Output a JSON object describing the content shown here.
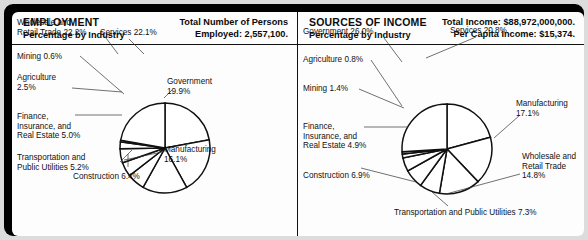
{
  "panels": [
    {
      "id": "employment",
      "title": "EMPLOYMENT",
      "subtitle": "Percentage by Industry",
      "stat_line_1": "Total Number of Persons",
      "stat_line_2": "Employed: 2,557,100.",
      "chart": {
        "type": "pie",
        "title": "EMPLOYMENT",
        "subtitle": "Percentage by Industry",
        "unit": "percent",
        "center": [
          153,
          136
        ],
        "radius": 45,
        "start_angle_deg": -90,
        "direction": "clockwise",
        "categories": [
          "Services",
          "Government",
          "Manufacturing",
          "Construction",
          "Transportation and Public Utilities",
          "Finance, Insurance, and Real Estate",
          "Agriculture",
          "Mining",
          "Wholesale and Retail Trade"
        ],
        "values": [
          22.1,
          19.9,
          16.1,
          6.4,
          5.2,
          5.0,
          2.5,
          0.6,
          22.2
        ],
        "labels": [
          {
            "text": "Services 22.1%",
            "x": 88,
            "y": 16,
            "align": "left",
            "lead": [
              [
                117,
                27
              ],
              [
                132,
                42
              ]
            ]
          },
          {
            "text": "Government\n19.9%",
            "x": 155,
            "y": 65,
            "align": "left",
            "lead": [
              [
                160,
                78
              ],
              [
                152,
                86
              ]
            ]
          },
          {
            "text": "Manufacturing\n16.1%",
            "x": 152,
            "y": 133,
            "align": "left",
            "lead": [
              [
                150,
                140
              ],
              [
                112,
                148
              ]
            ]
          },
          {
            "text": "Construction 6.4%",
            "x": 61,
            "y": 160,
            "align": "left",
            "lead": [
              [
                116,
                155
              ],
              [
                116,
                142
              ]
            ]
          },
          {
            "text": "Transportation and\nPublic Utilities 5.2%",
            "x": 5,
            "y": 141,
            "align": "left",
            "lead": [
              [
                108,
                150
              ],
              [
                120,
                138
              ]
            ]
          },
          {
            "text": "Finance,\nInsurance, and\nReal Estate 5.0%",
            "x": 5,
            "y": 100,
            "align": "left",
            "lead": [
              [
                63,
                103
              ],
              [
                110,
                103
              ]
            ]
          },
          {
            "text": "Agriculture\n2.5%",
            "x": 5,
            "y": 61,
            "align": "left",
            "lead": [
              [
                60,
                76
              ],
              [
                110,
                80
              ]
            ]
          },
          {
            "text": "Mining 0.6%",
            "x": 5,
            "y": 40,
            "align": "left",
            "lead": [
              [
                68,
                44
              ],
              [
                112,
                82
              ]
            ]
          },
          {
            "text": "Wholesale and\nRetail Trade 22.2%",
            "x": 5,
            "y": 6,
            "align": "left",
            "lead": [
              [
                91,
                22
              ],
              [
                106,
                42
              ]
            ]
          }
        ]
      }
    },
    {
      "id": "sources-of-income",
      "title": "SOURCES OF INCOME",
      "subtitle": "Percentage by Industry",
      "stat_line_1": "Total Income: $88,972,000,000.",
      "stat_line_2": "Per Capita Income: $15,374.",
      "chart": {
        "type": "pie",
        "title": "SOURCES OF INCOME",
        "subtitle": "Percentage by Industry",
        "unit": "percent",
        "center": [
          149,
          137
        ],
        "radius": 45,
        "start_angle_deg": -90,
        "direction": "clockwise",
        "categories": [
          "Services",
          "Manufacturing",
          "Wholesale and Retail Trade",
          "Transportation and Public Utilities",
          "Construction",
          "Finance, Insurance, and Real Estate",
          "Mining",
          "Agriculture",
          "Government"
        ],
        "values": [
          20.8,
          17.1,
          14.8,
          7.3,
          6.9,
          4.9,
          1.4,
          0.8,
          26.0
        ],
        "labels": [
          {
            "text": "Services 20.8%",
            "x": 152,
            "y": 14,
            "align": "left",
            "lead": [
              [
                178,
                25
              ],
              [
                128,
                46
              ]
            ]
          },
          {
            "text": "Manufacturing\n17.1%",
            "x": 218,
            "y": 87,
            "align": "left",
            "lead": [
              [
                222,
                103
              ],
              [
                196,
                126
              ]
            ]
          },
          {
            "text": "Wholesale and\nRetail Trade\n14.8%",
            "x": 224,
            "y": 140,
            "align": "left",
            "lead": [
              [
                222,
                162
              ],
              [
                148,
                182
              ]
            ]
          },
          {
            "text": "Transportation and Public Utilities 7.3%",
            "x": 96,
            "y": 196,
            "align": "left",
            "lead": [
              [
                150,
                194
              ],
              [
                134,
                180
              ]
            ]
          },
          {
            "text": "Construction 6.9%",
            "x": 5,
            "y": 159,
            "align": "left",
            "lead": [
              [
                63,
                156
              ],
              [
                118,
                170
              ]
            ]
          },
          {
            "text": "Finance,\nInsurance, and\nReal Estate 4.9%",
            "x": 5,
            "y": 110,
            "align": "left",
            "lead": [
              [
                66,
                115
              ],
              [
                110,
                115
              ]
            ]
          },
          {
            "text": "Mining 1.4%",
            "x": 5,
            "y": 72,
            "align": "left",
            "lead": [
              [
                61,
                77
              ],
              [
                106,
                96
              ]
            ]
          },
          {
            "text": "Agriculture 0.8%",
            "x": 5,
            "y": 43,
            "align": "left",
            "lead": [
              [
                73,
                48
              ],
              [
                104,
                94
              ]
            ]
          },
          {
            "text": "Government 26.0%",
            "x": 5,
            "y": 15,
            "align": "left",
            "lead": [
              [
                86,
                26
              ],
              [
                104,
                50
              ]
            ]
          }
        ]
      }
    }
  ]
}
